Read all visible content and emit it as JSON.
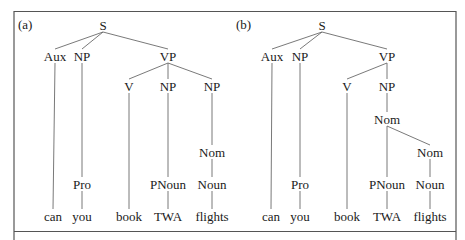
{
  "figure": {
    "panels": [
      {
        "label": "(a)",
        "nodes": [
          {
            "id": "S",
            "text": "S",
            "x": 103,
            "y": 25
          },
          {
            "id": "Aux",
            "text": "Aux",
            "x": 55,
            "y": 56
          },
          {
            "id": "NP1",
            "text": "NP",
            "x": 82,
            "y": 56
          },
          {
            "id": "VP",
            "text": "VP",
            "x": 168,
            "y": 56
          },
          {
            "id": "V",
            "text": "V",
            "x": 129,
            "y": 86
          },
          {
            "id": "NP2",
            "text": "NP",
            "x": 168,
            "y": 86
          },
          {
            "id": "NP3",
            "text": "NP",
            "x": 212,
            "y": 86
          },
          {
            "id": "Nom",
            "text": "Nom",
            "x": 212,
            "y": 152
          },
          {
            "id": "Pro",
            "text": "Pro",
            "x": 82,
            "y": 184
          },
          {
            "id": "PNoun",
            "text": "PNoun",
            "x": 168,
            "y": 184
          },
          {
            "id": "Noun",
            "text": "Noun",
            "x": 212,
            "y": 184
          },
          {
            "id": "w_can",
            "text": "can",
            "x": 53,
            "y": 216
          },
          {
            "id": "w_you",
            "text": "you",
            "x": 82,
            "y": 216
          },
          {
            "id": "w_book",
            "text": "book",
            "x": 129,
            "y": 216
          },
          {
            "id": "w_TWA",
            "text": "TWA",
            "x": 168,
            "y": 216
          },
          {
            "id": "w_flights",
            "text": "flights",
            "x": 212,
            "y": 216
          }
        ],
        "edges": [
          [
            "S",
            "Aux"
          ],
          [
            "S",
            "NP1"
          ],
          [
            "S",
            "VP"
          ],
          [
            "VP",
            "V"
          ],
          [
            "VP",
            "NP2"
          ],
          [
            "VP",
            "NP3"
          ],
          [
            "Aux",
            "w_can"
          ],
          [
            "NP1",
            "Pro"
          ],
          [
            "Pro",
            "w_you"
          ],
          [
            "V",
            "w_book"
          ],
          [
            "NP2",
            "PNoun"
          ],
          [
            "PNoun",
            "w_TWA"
          ],
          [
            "NP3",
            "Nom"
          ],
          [
            "Nom",
            "Noun"
          ],
          [
            "Noun",
            "w_flights"
          ]
        ]
      },
      {
        "label": "(b)",
        "nodes": [
          {
            "id": "S",
            "text": "S",
            "x": 322,
            "y": 25
          },
          {
            "id": "Aux",
            "text": "Aux",
            "x": 272,
            "y": 56
          },
          {
            "id": "NP1",
            "text": "NP",
            "x": 300,
            "y": 56
          },
          {
            "id": "VP",
            "text": "VP",
            "x": 387,
            "y": 56
          },
          {
            "id": "V",
            "text": "V",
            "x": 347,
            "y": 86
          },
          {
            "id": "NP2",
            "text": "NP",
            "x": 387,
            "y": 86
          },
          {
            "id": "Nom1",
            "text": "Nom",
            "x": 387,
            "y": 119
          },
          {
            "id": "Nom2",
            "text": "Nom",
            "x": 430,
            "y": 152
          },
          {
            "id": "Pro",
            "text": "Pro",
            "x": 300,
            "y": 184
          },
          {
            "id": "PNoun",
            "text": "PNoun",
            "x": 387,
            "y": 184
          },
          {
            "id": "Noun",
            "text": "Noun",
            "x": 430,
            "y": 184
          },
          {
            "id": "w_can",
            "text": "can",
            "x": 271,
            "y": 216
          },
          {
            "id": "w_you",
            "text": "you",
            "x": 300,
            "y": 216
          },
          {
            "id": "w_book",
            "text": "book",
            "x": 347,
            "y": 216
          },
          {
            "id": "w_TWA",
            "text": "TWA",
            "x": 387,
            "y": 216
          },
          {
            "id": "w_flights",
            "text": "flights",
            "x": 430,
            "y": 216
          }
        ],
        "edges": [
          [
            "S",
            "Aux"
          ],
          [
            "S",
            "NP1"
          ],
          [
            "S",
            "VP"
          ],
          [
            "VP",
            "V"
          ],
          [
            "VP",
            "NP2"
          ],
          [
            "Aux",
            "w_can"
          ],
          [
            "NP1",
            "Pro"
          ],
          [
            "Pro",
            "w_you"
          ],
          [
            "V",
            "w_book"
          ],
          [
            "NP2",
            "Nom1"
          ],
          [
            "Nom1",
            "PNoun"
          ],
          [
            "Nom1",
            "Nom2"
          ],
          [
            "PNoun",
            "w_TWA"
          ],
          [
            "Nom2",
            "Noun"
          ],
          [
            "Noun",
            "w_flights"
          ]
        ]
      }
    ],
    "panel_label_positions": [
      {
        "x": 18,
        "y": 29
      },
      {
        "x": 236,
        "y": 29
      }
    ],
    "colors": {
      "text": "#1a1a1a",
      "edge": "#6a6a6a",
      "frame": "#555555",
      "background": "#ffffff"
    }
  }
}
